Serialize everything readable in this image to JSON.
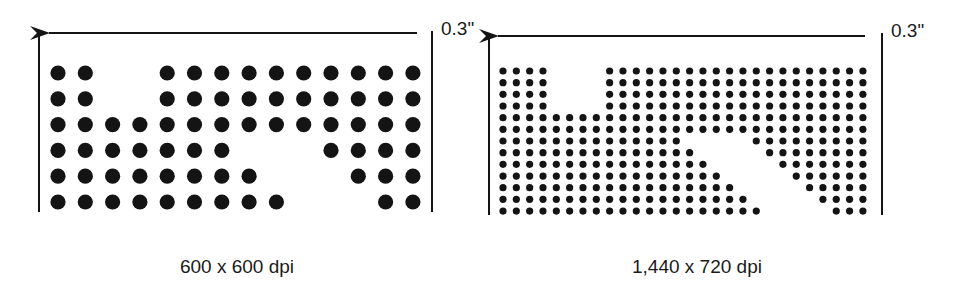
{
  "diagram": {
    "ink_color": "#141414",
    "panels": [
      {
        "id": "low-res",
        "caption": "600 x 600 dpi",
        "width_label": "0.3\"",
        "grid": {
          "cols": 14,
          "rows": 6,
          "x0": 58,
          "y0": 73,
          "dx": 27.3,
          "dy": 25.8,
          "r": 7.6
        },
        "rows": [
          [
            [
              1,
              2
            ],
            [
              5,
              14
            ]
          ],
          [
            [
              1,
              2
            ],
            [
              5,
              14
            ]
          ],
          [
            [
              1,
              14
            ]
          ],
          [
            [
              1,
              7
            ],
            [
              11,
              14
            ]
          ],
          [
            [
              1,
              8
            ],
            [
              12,
              14
            ]
          ],
          [
            [
              1,
              9
            ],
            [
              13,
              14
            ]
          ]
        ],
        "frame": {
          "left_x": 39,
          "right_x": 432,
          "top_y": 31,
          "bottom_y": 212,
          "arrow_y": 33,
          "arrow_tip_x": 49,
          "arrow_tail_x": 417
        },
        "width_label_pos": {
          "x": 441,
          "y": 35
        },
        "caption_pos": {
          "x": 237,
          "y": 273
        }
      },
      {
        "id": "high-res",
        "caption": "1,440 x 720 dpi",
        "width_label": "0.3\"",
        "grid": {
          "cols": 28,
          "rows": 13,
          "x0": 503,
          "y0": 71,
          "dx": 13.33,
          "dy": 11.67,
          "r": 3.6
        },
        "rows": [
          [
            [
              1,
              4
            ],
            [
              9,
              28
            ]
          ],
          [
            [
              1,
              4
            ],
            [
              9,
              28
            ]
          ],
          [
            [
              1,
              4
            ],
            [
              9,
              28
            ]
          ],
          [
            [
              1,
              4
            ],
            [
              9,
              28
            ]
          ],
          [
            [
              1,
              28
            ]
          ],
          [
            [
              1,
              28
            ]
          ],
          [
            [
              1,
              14
            ],
            [
              20,
              28
            ]
          ],
          [
            [
              1,
              15
            ],
            [
              21,
              28
            ]
          ],
          [
            [
              1,
              16
            ],
            [
              22,
              28
            ]
          ],
          [
            [
              1,
              17
            ],
            [
              23,
              28
            ]
          ],
          [
            [
              1,
              18
            ],
            [
              24,
              28
            ]
          ],
          [
            [
              1,
              19
            ],
            [
              25,
              28
            ]
          ],
          [
            [
              1,
              20
            ],
            [
              26,
              28
            ]
          ]
        ],
        "frame": {
          "left_x": 489,
          "right_x": 882,
          "top_y": 33,
          "bottom_y": 215,
          "arrow_y": 36,
          "arrow_tip_x": 498,
          "arrow_tail_x": 865
        },
        "width_label_pos": {
          "x": 891,
          "y": 37
        },
        "caption_pos": {
          "x": 697,
          "y": 273
        }
      }
    ]
  }
}
